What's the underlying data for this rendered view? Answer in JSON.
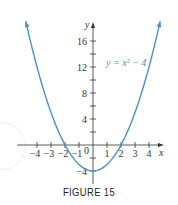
{
  "figure": {
    "caption": "FIGURE 15"
  },
  "colors": {
    "curve": "#4a92c4",
    "axes": "#333333",
    "text": "#333333"
  },
  "chart_data": {
    "type": "line",
    "title": "",
    "function": "y = x^2 - 4",
    "annotation": "y = x² − 4",
    "xlabel": "x",
    "ylabel": "y",
    "xlim": [
      -4.8,
      4.8
    ],
    "ylim": [
      -5.5,
      18.5
    ],
    "grid": false,
    "legend": "none",
    "x_ticks": [
      -4,
      -3,
      -2,
      -1,
      0,
      1,
      2,
      3,
      4
    ],
    "x_tick_labels": [
      "−4",
      "−3",
      "−2",
      "−1",
      "0",
      "1",
      "2",
      "3",
      "4"
    ],
    "y_ticks_minor": [
      -4,
      -2,
      2,
      4,
      6,
      8,
      10,
      12,
      14,
      16
    ],
    "y_tick_labels": [
      "16",
      "12",
      "8",
      "4",
      "−4"
    ],
    "series": [
      {
        "name": "y = x² − 4",
        "x": [
          -4.8,
          -4,
          -3,
          -2,
          -1,
          0,
          1,
          2,
          3,
          4,
          4.8
        ],
        "y": [
          19.04,
          12,
          5,
          0,
          -3,
          -4,
          -3,
          0,
          5,
          12,
          19.04
        ]
      }
    ],
    "key_points": {
      "vertex": [
        0,
        -4
      ],
      "x_intercepts": [
        [
          -2,
          0
        ],
        [
          2,
          0
        ]
      ],
      "y_intercept": [
        0,
        -4
      ]
    }
  }
}
